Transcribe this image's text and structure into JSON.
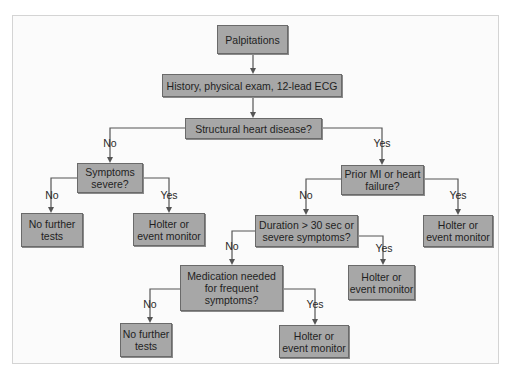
{
  "diagram": {
    "nodes": [
      {
        "id": "palpitations",
        "text": "Palpitations"
      },
      {
        "id": "history",
        "text": "History, physical exam, 12-lead ECG"
      },
      {
        "id": "structural",
        "text": "Structural heart disease?"
      },
      {
        "id": "symptoms_severe",
        "text": "Symptoms severe?"
      },
      {
        "id": "no_tests_1",
        "text": "No further tests"
      },
      {
        "id": "holter_1",
        "text": "Holter or event monitor"
      },
      {
        "id": "prior_mi",
        "text": "Prior MI or heart failure?"
      },
      {
        "id": "holter_2",
        "text": "Holter or event monitor"
      },
      {
        "id": "duration",
        "text": "Duration > 30 sec or severe symptoms?"
      },
      {
        "id": "holter_3",
        "text": "Holter or event monitor"
      },
      {
        "id": "medication",
        "text": "Medication needed for frequent symptoms?"
      },
      {
        "id": "no_tests_2",
        "text": "No further tests"
      },
      {
        "id": "holter_4",
        "text": "Holter or event monitor"
      }
    ],
    "edges": [
      {
        "from": "palpitations",
        "to": "history",
        "label": ""
      },
      {
        "from": "history",
        "to": "structural",
        "label": ""
      },
      {
        "from": "structural",
        "to": "symptoms_severe",
        "label": "No"
      },
      {
        "from": "structural",
        "to": "prior_mi",
        "label": "Yes"
      },
      {
        "from": "symptoms_severe",
        "to": "no_tests_1",
        "label": "No"
      },
      {
        "from": "symptoms_severe",
        "to": "holter_1",
        "label": "Yes"
      },
      {
        "from": "prior_mi",
        "to": "duration",
        "label": "No"
      },
      {
        "from": "prior_mi",
        "to": "holter_2",
        "label": "Yes"
      },
      {
        "from": "duration",
        "to": "medication",
        "label": "No"
      },
      {
        "from": "duration",
        "to": "holter_3",
        "label": "Yes"
      },
      {
        "from": "medication",
        "to": "no_tests_2",
        "label": "No"
      },
      {
        "from": "medication",
        "to": "holter_4",
        "label": "Yes"
      }
    ]
  },
  "labels": {
    "palpitations": "Palpitations",
    "history": "History, physical exam, 12-lead ECG",
    "structural": "Structural heart disease?",
    "symptoms_severe_l1": "Symptoms",
    "symptoms_severe_l2": "severe?",
    "no_tests_l1": "No further",
    "no_tests_l2": "tests",
    "holter_l1": "Holter or",
    "holter_l2": "event monitor",
    "prior_mi_l1": "Prior MI or heart",
    "prior_mi_l2": "failure?",
    "duration_l1": "Duration > 30 sec or",
    "duration_l2": "severe symptoms?",
    "medication_l1": "Medication needed",
    "medication_l2": "for frequent",
    "medication_l3": "symptoms?",
    "yes": "Yes",
    "no": "No"
  },
  "colors": {
    "node_fill": "#a7a7a7",
    "node_border": "#6a6a6a",
    "edge": "#555555"
  }
}
